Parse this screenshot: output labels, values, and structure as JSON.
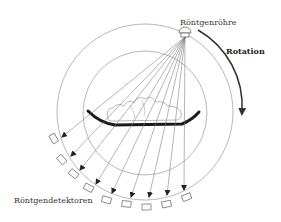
{
  "labels": {
    "source": "Röntgenröhre",
    "rotation": "Rotation",
    "detectors": "Röntgendetektoren"
  },
  "colors": {
    "line": "#888888",
    "ink": "#222222",
    "background": "#ffffff"
  },
  "geometry": {
    "center": [
      145,
      112
    ],
    "outer_radius": 88,
    "inner_radius": 62,
    "source_position": [
      185,
      35
    ],
    "detector_count": 9
  }
}
